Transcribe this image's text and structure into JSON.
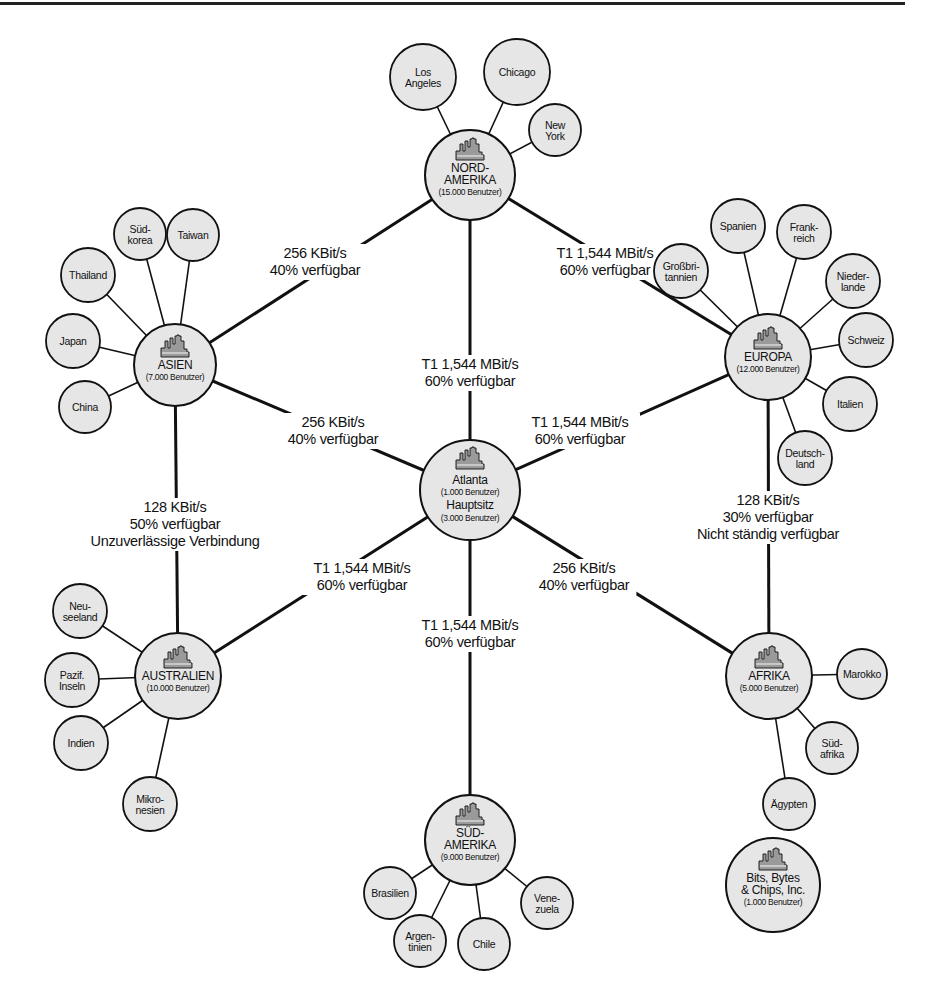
{
  "diagram": {
    "type": "network-topology",
    "colors": {
      "node_fill": "#e6e6e6",
      "stroke": "#111111",
      "icon_fill": "#9a9a9a",
      "background": "#ffffff"
    },
    "hubs": [
      {
        "id": "nordamerika",
        "lines": [
          "NORD-",
          "AMERIKA"
        ],
        "users": "(15.000 Benutzer)",
        "cx": 470,
        "cy": 175,
        "r": 45
      },
      {
        "id": "asien",
        "lines": [
          "ASIEN"
        ],
        "users": "(7.000 Benutzer)",
        "cx": 175,
        "cy": 365,
        "r": 41
      },
      {
        "id": "europa",
        "lines": [
          "EUROPA"
        ],
        "users": "(12.000 Benutzer)",
        "cx": 768,
        "cy": 357,
        "r": 43
      },
      {
        "id": "atlanta",
        "lines": [
          "Atlanta"
        ],
        "users": "(1.000 Benutzer)",
        "lines2": [
          "Hauptsitz"
        ],
        "users2": "(3.000 Benutzer)",
        "cx": 470,
        "cy": 490,
        "r": 50
      },
      {
        "id": "australien",
        "lines": [
          "AUSTRALIEN"
        ],
        "users": "(10.000 Benutzer)",
        "cx": 178,
        "cy": 676,
        "r": 43
      },
      {
        "id": "afrika",
        "lines": [
          "AFRIKA"
        ],
        "users": "(5.000 Benutzer)",
        "cx": 769,
        "cy": 676,
        "r": 43
      },
      {
        "id": "suedamerika",
        "lines": [
          "SÜD-",
          "AMERIKA"
        ],
        "users": "(9.000 Benutzer)",
        "cx": 470,
        "cy": 840,
        "r": 45
      },
      {
        "id": "bitsbytes",
        "lines": [
          "Bits, Bytes",
          "& Chips, Inc."
        ],
        "users": "(1.000 Benutzer)",
        "cx": 773,
        "cy": 885,
        "r": 47
      }
    ],
    "leaves": [
      {
        "hub": "nordamerika",
        "lines": [
          "Los",
          "Angeles"
        ],
        "cx": 423,
        "cy": 77,
        "r": 33
      },
      {
        "hub": "nordamerika",
        "lines": [
          "Chicago"
        ],
        "cx": 517,
        "cy": 72,
        "r": 33
      },
      {
        "hub": "nordamerika",
        "lines": [
          "New",
          "York"
        ],
        "cx": 555,
        "cy": 130,
        "r": 26
      },
      {
        "hub": "asien",
        "lines": [
          "Süd-",
          "korea"
        ],
        "cx": 140,
        "cy": 234,
        "r": 26
      },
      {
        "hub": "asien",
        "lines": [
          "Taiwan"
        ],
        "cx": 193,
        "cy": 235,
        "r": 26
      },
      {
        "hub": "asien",
        "lines": [
          "Thailand"
        ],
        "cx": 88,
        "cy": 275,
        "r": 27
      },
      {
        "hub": "asien",
        "lines": [
          "Japan"
        ],
        "cx": 73,
        "cy": 341,
        "r": 27
      },
      {
        "hub": "asien",
        "lines": [
          "China"
        ],
        "cx": 85,
        "cy": 407,
        "r": 26
      },
      {
        "hub": "europa",
        "lines": [
          "Großbri-",
          "tannien"
        ],
        "cx": 681,
        "cy": 271,
        "r": 27
      },
      {
        "hub": "europa",
        "lines": [
          "Spanien"
        ],
        "cx": 738,
        "cy": 226,
        "r": 27
      },
      {
        "hub": "europa",
        "lines": [
          "Frank-",
          "reich"
        ],
        "cx": 804,
        "cy": 232,
        "r": 27
      },
      {
        "hub": "europa",
        "lines": [
          "Nieder-",
          "lande"
        ],
        "cx": 853,
        "cy": 281,
        "r": 27
      },
      {
        "hub": "europa",
        "lines": [
          "Schweiz"
        ],
        "cx": 866,
        "cy": 340,
        "r": 27
      },
      {
        "hub": "europa",
        "lines": [
          "Italien"
        ],
        "cx": 850,
        "cy": 404,
        "r": 27
      },
      {
        "hub": "europa",
        "lines": [
          "Deutsch-",
          "land"
        ],
        "cx": 805,
        "cy": 458,
        "r": 27
      },
      {
        "hub": "australien",
        "lines": [
          "Neu-",
          "seeland"
        ],
        "cx": 80,
        "cy": 611,
        "r": 27
      },
      {
        "hub": "australien",
        "lines": [
          "Pazif.",
          "Inseln"
        ],
        "cx": 72,
        "cy": 680,
        "r": 27
      },
      {
        "hub": "australien",
        "lines": [
          "Indien"
        ],
        "cx": 81,
        "cy": 743,
        "r": 27
      },
      {
        "hub": "australien",
        "lines": [
          "Mikro-",
          "nesien"
        ],
        "cx": 150,
        "cy": 804,
        "r": 27
      },
      {
        "hub": "afrika",
        "lines": [
          "Marokko"
        ],
        "cx": 862,
        "cy": 674,
        "r": 25
      },
      {
        "hub": "afrika",
        "lines": [
          "Süd-",
          "afrika"
        ],
        "cx": 832,
        "cy": 748,
        "r": 26
      },
      {
        "hub": "afrika",
        "lines": [
          "Ägypten"
        ],
        "cx": 789,
        "cy": 804,
        "r": 26
      },
      {
        "hub": "suedamerika",
        "lines": [
          "Brasilien"
        ],
        "cx": 390,
        "cy": 893,
        "r": 26
      },
      {
        "hub": "suedamerika",
        "lines": [
          "Argen-",
          "tinien"
        ],
        "cx": 420,
        "cy": 941,
        "r": 26
      },
      {
        "hub": "suedamerika",
        "lines": [
          "Chile"
        ],
        "cx": 484,
        "cy": 944,
        "r": 26
      },
      {
        "hub": "suedamerika",
        "lines": [
          "Vene-",
          "zuela"
        ],
        "cx": 547,
        "cy": 903,
        "r": 26
      }
    ],
    "links": [
      {
        "from": "nordamerika",
        "to": "asien",
        "label": [
          "256 KBit/s",
          "40% verfügbar"
        ],
        "lx": 315,
        "ly": 258
      },
      {
        "from": "nordamerika",
        "to": "europa",
        "label": [
          "T1 1,544 MBit/s",
          "60% verfügbar"
        ],
        "lx": 605,
        "ly": 258
      },
      {
        "from": "nordamerika",
        "to": "atlanta",
        "label": [
          "T1 1,544 MBit/s",
          "60% verfügbar"
        ],
        "lx": 470,
        "ly": 369
      },
      {
        "from": "asien",
        "to": "atlanta",
        "label": [
          "256 KBit/s",
          "40% verfügbar"
        ],
        "lx": 333,
        "ly": 427
      },
      {
        "from": "europa",
        "to": "atlanta",
        "label": [
          "T1 1,544 MBit/s",
          "60% verfügbar"
        ],
        "lx": 580,
        "ly": 427
      },
      {
        "from": "asien",
        "to": "australien",
        "label": [
          "128 KBit/s",
          "50% verfügbar",
          "Unzuverlässige Verbindung"
        ],
        "lx": 175,
        "ly": 512
      },
      {
        "from": "europa",
        "to": "afrika",
        "label": [
          "128 KBit/s",
          "30% verfügbar",
          "Nicht ständig verfügbar"
        ],
        "lx": 768,
        "ly": 505
      },
      {
        "from": "atlanta",
        "to": "australien",
        "label": [
          "T1 1,544 MBit/s",
          "60% verfügbar"
        ],
        "lx": 362,
        "ly": 573
      },
      {
        "from": "atlanta",
        "to": "afrika",
        "label": [
          "256 KBit/s",
          "40% verfügbar"
        ],
        "lx": 584,
        "ly": 573
      },
      {
        "from": "atlanta",
        "to": "suedamerika",
        "label": [
          "T1 1,544 MBit/s",
          "60% verfügbar"
        ],
        "lx": 470,
        "ly": 630
      }
    ]
  }
}
